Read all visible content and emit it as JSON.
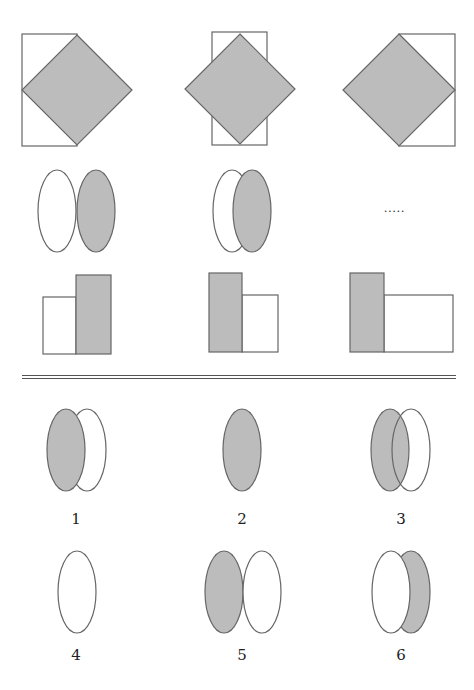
{
  "colors": {
    "fill_gray": "#bcbcbc",
    "stroke": "#666666",
    "background": "#ffffff"
  },
  "question": {
    "rows": [
      {
        "row": "diamond-rectangle",
        "panels": [
          {
            "diamond": {
              "cx": 77,
              "cy": 90,
              "r": 55
            },
            "rect": {
              "x": 22,
              "y": 34,
              "w": 55,
              "h": 112
            }
          },
          {
            "diamond": {
              "cx": 240,
              "cy": 89,
              "r": 55
            },
            "rect": {
              "x": 212,
              "y": 32,
              "w": 55,
              "h": 113
            }
          },
          {
            "diamond": {
              "cx": 399,
              "cy": 90,
              "r": 56
            },
            "rect": {
              "x": 399,
              "y": 34,
              "w": 56,
              "h": 112
            }
          }
        ]
      },
      {
        "row": "ellipses",
        "panels": [
          {
            "white": {
              "cx": 57,
              "cy": 211,
              "rx": 19,
              "ry": 41
            },
            "gray": {
              "cx": 96,
              "cy": 211,
              "rx": 19,
              "ry": 41
            },
            "gray_on_top": true
          },
          {
            "white": {
              "cx": 232,
              "cy": 211,
              "rx": 19,
              "ry": 41
            },
            "gray": {
              "cx": 252,
              "cy": 211,
              "rx": 19,
              "ry": 41
            },
            "gray_on_top": true
          },
          {
            "placeholder": "....."
          }
        ]
      },
      {
        "row": "rectangles",
        "panels": [
          {
            "white": {
              "x": 43,
              "y": 297,
              "w": 33,
              "h": 57
            },
            "gray": {
              "x": 76,
              "y": 275,
              "w": 35,
              "h": 79
            }
          },
          {
            "gray": {
              "x": 209,
              "y": 273,
              "w": 33,
              "h": 79
            },
            "white": {
              "x": 242,
              "y": 295,
              "w": 36,
              "h": 57
            }
          },
          {
            "gray": {
              "x": 350,
              "y": 273,
              "w": 34,
              "h": 79
            },
            "white": {
              "x": 384,
              "y": 295,
              "w": 69,
              "h": 57
            }
          }
        ]
      }
    ],
    "missing_placeholder": ".....",
    "divider": {
      "x1": 22,
      "x2": 456,
      "y": 377
    }
  },
  "options": [
    {
      "label": "1",
      "label_x": 76,
      "label_y": 511,
      "shapes": [
        {
          "type": "white",
          "cx": 87,
          "cy": 450,
          "rx": 19,
          "ry": 41
        },
        {
          "type": "gray",
          "cx": 66,
          "cy": 450,
          "rx": 19,
          "ry": 41
        }
      ]
    },
    {
      "label": "2",
      "label_x": 242,
      "label_y": 511,
      "shapes": [
        {
          "type": "gray",
          "cx": 242,
          "cy": 450,
          "rx": 19,
          "ry": 41
        }
      ]
    },
    {
      "label": "3",
      "label_x": 401,
      "label_y": 511,
      "shapes": [
        {
          "type": "gray",
          "cx": 390,
          "cy": 450,
          "rx": 19,
          "ry": 41
        },
        {
          "type": "outline",
          "cx": 411,
          "cy": 450,
          "rx": 19,
          "ry": 41
        }
      ]
    },
    {
      "label": "4",
      "label_x": 76,
      "label_y": 647,
      "shapes": [
        {
          "type": "white",
          "cx": 77,
          "cy": 592,
          "rx": 19,
          "ry": 41
        }
      ]
    },
    {
      "label": "5",
      "label_x": 242,
      "label_y": 647,
      "shapes": [
        {
          "type": "gray",
          "cx": 224,
          "cy": 592,
          "rx": 19,
          "ry": 41
        },
        {
          "type": "white",
          "cx": 262,
          "cy": 592,
          "rx": 19,
          "ry": 41
        }
      ]
    },
    {
      "label": "6",
      "label_x": 401,
      "label_y": 647,
      "shapes": [
        {
          "type": "gray",
          "cx": 411,
          "cy": 592,
          "rx": 19,
          "ry": 41
        },
        {
          "type": "white",
          "cx": 391,
          "cy": 592,
          "rx": 19,
          "ry": 41
        }
      ]
    }
  ]
}
